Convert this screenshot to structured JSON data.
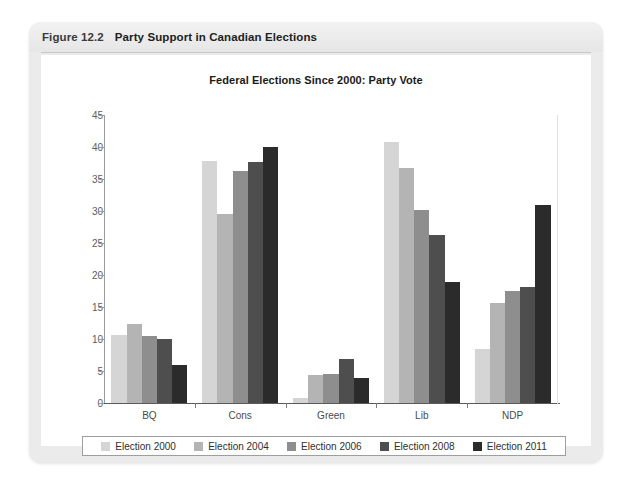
{
  "figure": {
    "number": "Figure 12.2",
    "title": "Party Support in Canadian Elections"
  },
  "chart_data": {
    "type": "bar",
    "title": "Federal Elections Since 2000: Party Vote",
    "xlabel": "",
    "ylabel": "",
    "ylim": [
      0,
      45
    ],
    "ytick_step": 5,
    "yticks": [
      "0",
      "5",
      "10",
      "15",
      "20",
      "25",
      "30",
      "35",
      "40",
      "45"
    ],
    "grid": false,
    "legend_position": "bottom",
    "categories": [
      "BQ",
      "Cons",
      "Green",
      "Lib",
      "NDP"
    ],
    "series": [
      {
        "name": "Election 2000",
        "color": "#d5d5d5",
        "values": [
          10.7,
          37.8,
          0.8,
          40.8,
          8.5
        ]
      },
      {
        "name": "Election 2004",
        "color": "#b4b4b4",
        "values": [
          12.4,
          29.6,
          4.3,
          36.7,
          15.7
        ]
      },
      {
        "name": "Election 2006",
        "color": "#8e8e8e",
        "values": [
          10.5,
          36.3,
          4.5,
          30.2,
          17.5
        ]
      },
      {
        "name": "Election 2008",
        "color": "#4e4e4e",
        "values": [
          10.0,
          37.6,
          6.8,
          26.2,
          18.2
        ]
      },
      {
        "name": "Election 2011",
        "color": "#2b2b2b",
        "values": [
          6.0,
          40.0,
          3.9,
          18.9,
          31.0
        ]
      }
    ]
  }
}
